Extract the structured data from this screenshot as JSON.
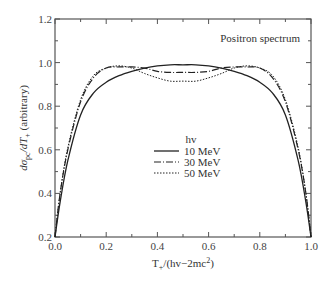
{
  "chart_data": {
    "type": "line",
    "title": "Positron spectrum",
    "xlabel": "T+/(hν−2mc²)",
    "ylabel": "dσpc/dT+ (arbitrary)",
    "xlim": [
      0.0,
      1.0
    ],
    "ylim": [
      0.2,
      1.2
    ],
    "xticks": [
      "0.0",
      "0.2",
      "0.4",
      "0.6",
      "0.8",
      "1.0"
    ],
    "yticks": [
      "0.2",
      "0.4",
      "0.6",
      "0.8",
      "1.0",
      "1.2"
    ],
    "grid": false,
    "legend": {
      "title": "hv",
      "position": "center-right"
    },
    "x": [
      0.0,
      0.02,
      0.05,
      0.1,
      0.15,
      0.2,
      0.25,
      0.3,
      0.35,
      0.4,
      0.45,
      0.5,
      0.55,
      0.6,
      0.65,
      0.7,
      0.75,
      0.8,
      0.85,
      0.9,
      0.95,
      0.98,
      1.0
    ],
    "series": [
      {
        "name": "10 MeV",
        "style": "solid",
        "values": [
          0.2,
          0.36,
          0.55,
          0.76,
          0.86,
          0.91,
          0.94,
          0.96,
          0.975,
          0.985,
          0.99,
          0.99,
          0.99,
          0.985,
          0.975,
          0.96,
          0.94,
          0.91,
          0.86,
          0.76,
          0.55,
          0.36,
          0.2
        ]
      },
      {
        "name": "30 MeV",
        "style": "dash-dot",
        "values": [
          0.2,
          0.4,
          0.6,
          0.82,
          0.93,
          0.975,
          0.98,
          0.98,
          0.975,
          0.96,
          0.955,
          0.955,
          0.955,
          0.96,
          0.975,
          0.98,
          0.98,
          0.975,
          0.93,
          0.82,
          0.6,
          0.4,
          0.2
        ]
      },
      {
        "name": "50 MeV",
        "style": "dotted",
        "values": [
          0.2,
          0.4,
          0.61,
          0.83,
          0.94,
          0.975,
          0.985,
          0.975,
          0.95,
          0.93,
          0.915,
          0.915,
          0.915,
          0.93,
          0.95,
          0.975,
          0.985,
          0.975,
          0.94,
          0.83,
          0.61,
          0.4,
          0.2
        ]
      }
    ]
  },
  "legend_items": [
    {
      "label": "10 MeV",
      "style": "solid"
    },
    {
      "label": "30 MeV",
      "style": "dash-dot"
    },
    {
      "label": "50 MeV",
      "style": "dotted"
    }
  ]
}
